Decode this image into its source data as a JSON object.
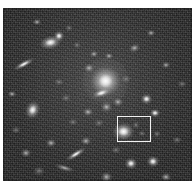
{
  "figure": {
    "kind": "astronomical-image",
    "caption": "",
    "alt_text": "Greyscale optical image of a rich galaxy cluster with a bright central elliptical galaxy and a white rectangle marking a region of interest in the lower right",
    "plate": {
      "x": 3,
      "y": 8,
      "width": 189,
      "height": 173,
      "background_color": "#222222",
      "sky_level_color": "#2b2b2b"
    },
    "highlight_box": {
      "label": "region-of-interest",
      "x": 114,
      "y": 108,
      "width": 34,
      "height": 26,
      "stroke_color": "#f2f2f2",
      "stroke_width": 1
    },
    "sources": [
      {
        "name": "bcg-central-elliptical",
        "x": 94,
        "y": 65,
        "w": 17,
        "h": 16,
        "brightness": "bright",
        "angle": 0,
        "halo": 46
      },
      {
        "name": "galaxy-upper-left-bright",
        "x": 41,
        "y": 30,
        "w": 13,
        "h": 8,
        "brightness": "bright",
        "angle": -12,
        "halo": 0
      },
      {
        "name": "star-upper-left-companion",
        "x": 53,
        "y": 25,
        "w": 6,
        "h": 6,
        "brightness": "bright",
        "angle": 0,
        "halo": 0
      },
      {
        "name": "edge-on-spiral-left",
        "x": 14,
        "y": 54,
        "w": 14,
        "h": 4,
        "brightness": "bright",
        "angle": -28,
        "halo": 0
      },
      {
        "name": "galaxy-mid-left-bright",
        "x": 24,
        "y": 98,
        "w": 11,
        "h": 9,
        "brightness": "bright",
        "angle": -70,
        "halo": 0
      },
      {
        "name": "galaxy-in-roi-box",
        "x": 114,
        "y": 118,
        "w": 13,
        "h": 11,
        "brightness": "bright",
        "angle": 0,
        "halo": 14
      },
      {
        "name": "galaxy-below-bcg",
        "x": 93,
        "y": 82,
        "w": 12,
        "h": 5,
        "brightness": "bright",
        "angle": -18,
        "halo": 0
      },
      {
        "name": "galaxy-center-small-1",
        "x": 83,
        "y": 57,
        "w": 6,
        "h": 5,
        "brightness": "mid",
        "angle": 0,
        "halo": 0
      },
      {
        "name": "galaxy-center-small-2",
        "x": 103,
        "y": 46,
        "w": 5,
        "h": 4,
        "brightness": "mid",
        "angle": 0,
        "halo": 0
      },
      {
        "name": "galaxy-center-small-3",
        "x": 88,
        "y": 44,
        "w": 5,
        "h": 4,
        "brightness": "mid",
        "angle": 0,
        "halo": 0
      },
      {
        "name": "galaxy-center-small-4",
        "x": 100,
        "y": 96,
        "w": 7,
        "h": 6,
        "brightness": "mid",
        "angle": 0,
        "halo": 0
      },
      {
        "name": "galaxy-center-small-5",
        "x": 82,
        "y": 101,
        "w": 6,
        "h": 5,
        "brightness": "mid",
        "angle": 0,
        "halo": 0
      },
      {
        "name": "galaxy-center-small-6",
        "x": 112,
        "y": 91,
        "w": 6,
        "h": 5,
        "brightness": "mid",
        "angle": 0,
        "halo": 0
      },
      {
        "name": "galaxy-right-bright-1",
        "x": 140,
        "y": 88,
        "w": 7,
        "h": 6,
        "brightness": "bright",
        "angle": 0,
        "halo": 0
      },
      {
        "name": "galaxy-right-bright-2",
        "x": 149,
        "y": 102,
        "w": 6,
        "h": 5,
        "brightness": "bright",
        "angle": 0,
        "halo": 0
      },
      {
        "name": "galaxy-upper-right-1",
        "x": 128,
        "y": 37,
        "w": 7,
        "h": 5,
        "brightness": "mid",
        "angle": -20,
        "halo": 0
      },
      {
        "name": "galaxy-upper-right-2",
        "x": 145,
        "y": 23,
        "w": 5,
        "h": 4,
        "brightness": "mid",
        "angle": 0,
        "halo": 0
      },
      {
        "name": "galaxy-upper-right-3",
        "x": 160,
        "y": 55,
        "w": 5,
        "h": 4,
        "brightness": "mid",
        "angle": 0,
        "halo": 0
      },
      {
        "name": "galaxy-upper-edge-1",
        "x": 31,
        "y": 12,
        "w": 5,
        "h": 4,
        "brightness": "mid",
        "angle": 0,
        "halo": 0
      },
      {
        "name": "galaxy-upper-edge-2",
        "x": 64,
        "y": 18,
        "w": 4,
        "h": 4,
        "brightness": "dim",
        "angle": 0,
        "halo": 0
      },
      {
        "name": "galaxy-left-edge-1",
        "x": 6,
        "y": 84,
        "w": 5,
        "h": 4,
        "brightness": "mid",
        "angle": 0,
        "halo": 0
      },
      {
        "name": "galaxy-left-edge-2",
        "x": 10,
        "y": 120,
        "w": 5,
        "h": 4,
        "brightness": "dim",
        "angle": 0,
        "halo": 0
      },
      {
        "name": "edge-on-spiral-lower-1",
        "x": 66,
        "y": 144,
        "w": 14,
        "h": 4,
        "brightness": "bright",
        "angle": -32,
        "halo": 0
      },
      {
        "name": "edge-on-spiral-lower-2",
        "x": 56,
        "y": 158,
        "w": 12,
        "h": 4,
        "brightness": "mid",
        "angle": 16,
        "halo": 0
      },
      {
        "name": "galaxy-lower-center-1",
        "x": 80,
        "y": 130,
        "w": 6,
        "h": 5,
        "brightness": "mid",
        "angle": 0,
        "halo": 0
      },
      {
        "name": "galaxy-lower-center-2",
        "x": 45,
        "y": 132,
        "w": 6,
        "h": 5,
        "brightness": "mid",
        "angle": 0,
        "halo": 0
      },
      {
        "name": "galaxy-lower-left-1",
        "x": 20,
        "y": 142,
        "w": 6,
        "h": 5,
        "brightness": "mid",
        "angle": 0,
        "halo": 0
      },
      {
        "name": "galaxy-lower-left-2",
        "x": 33,
        "y": 160,
        "w": 6,
        "h": 5,
        "brightness": "dim",
        "angle": 0,
        "halo": 0
      },
      {
        "name": "galaxy-bottom-right-1",
        "x": 124,
        "y": 152,
        "w": 8,
        "h": 7,
        "brightness": "bright",
        "angle": 0,
        "halo": 0
      },
      {
        "name": "galaxy-bottom-right-2",
        "x": 146,
        "y": 150,
        "w": 8,
        "h": 7,
        "brightness": "bright",
        "angle": 0,
        "halo": 0
      },
      {
        "name": "galaxy-bottom-right-3",
        "x": 160,
        "y": 166,
        "w": 6,
        "h": 5,
        "brightness": "mid",
        "angle": 0,
        "halo": 0
      },
      {
        "name": "galaxy-bottom-center",
        "x": 100,
        "y": 166,
        "w": 7,
        "h": 6,
        "brightness": "mid",
        "angle": 0,
        "halo": 0
      },
      {
        "name": "galaxy-right-edge-low",
        "x": 171,
        "y": 130,
        "w": 5,
        "h": 4,
        "brightness": "dim",
        "angle": 0,
        "halo": 0
      },
      {
        "name": "galaxy-right-edge-mid",
        "x": 176,
        "y": 74,
        "w": 5,
        "h": 4,
        "brightness": "dim",
        "angle": 0,
        "halo": 0
      },
      {
        "name": "galaxy-near-box-right",
        "x": 152,
        "y": 124,
        "w": 4,
        "h": 4,
        "brightness": "dim",
        "angle": 0,
        "halo": 0
      },
      {
        "name": "galaxy-in-box-faint-1",
        "x": 131,
        "y": 115,
        "w": 4,
        "h": 4,
        "brightness": "dim",
        "angle": 0,
        "halo": 0
      },
      {
        "name": "galaxy-in-box-faint-2",
        "x": 137,
        "y": 124,
        "w": 4,
        "h": 3,
        "brightness": "dim",
        "angle": 0,
        "halo": 0
      },
      {
        "name": "galaxy-mid-left-faint",
        "x": 53,
        "y": 72,
        "w": 5,
        "h": 4,
        "brightness": "dim",
        "angle": 0,
        "halo": 0
      },
      {
        "name": "galaxy-mid-left-faint-2",
        "x": 60,
        "y": 88,
        "w": 5,
        "h": 4,
        "brightness": "dim",
        "angle": 0,
        "halo": 0
      },
      {
        "name": "galaxy-upper-mid-faint",
        "x": 72,
        "y": 35,
        "w": 4,
        "h": 4,
        "brightness": "dim",
        "angle": 0,
        "halo": 0
      },
      {
        "name": "galaxy-lower-right-faint",
        "x": 110,
        "y": 140,
        "w": 5,
        "h": 4,
        "brightness": "dim",
        "angle": 0,
        "halo": 0
      },
      {
        "name": "galaxy-center-faint-7",
        "x": 120,
        "y": 69,
        "w": 5,
        "h": 4,
        "brightness": "dim",
        "angle": 0,
        "halo": 0
      },
      {
        "name": "galaxy-center-faint-8",
        "x": 67,
        "y": 112,
        "w": 5,
        "h": 4,
        "brightness": "dim",
        "angle": 0,
        "halo": 0
      },
      {
        "name": "galaxy-center-faint-9",
        "x": 93,
        "y": 113,
        "w": 5,
        "h": 4,
        "brightness": "dim",
        "angle": 0,
        "halo": 0
      }
    ]
  }
}
